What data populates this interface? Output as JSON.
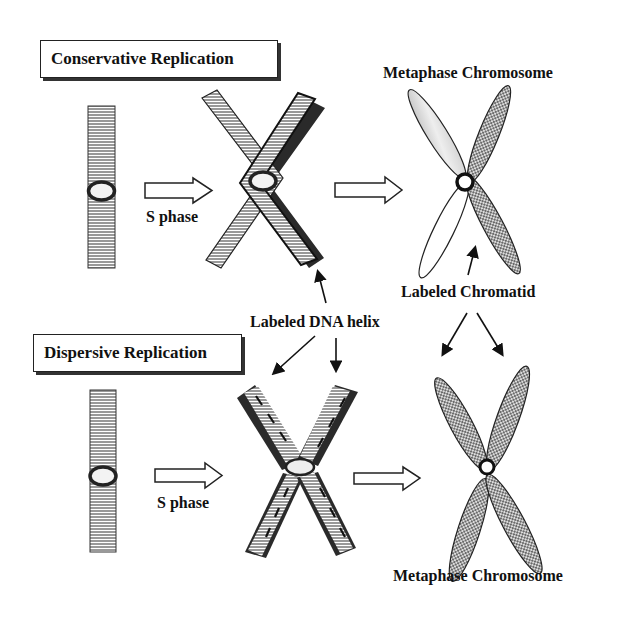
{
  "diagram": {
    "conservative": {
      "title": "Conservative Replication",
      "step_label": "S phase",
      "result_label": "Metaphase Chromosome"
    },
    "dispersive": {
      "title": "Dispersive Replication",
      "step_label": "S phase",
      "result_label": "Metaphase Chromosome"
    },
    "annotations": {
      "labeled_dna_helix": "Labeled DNA helix",
      "labeled_chromatid": "Labeled Chromatid"
    },
    "colors": {
      "ink": "#1a1a1a",
      "dark_strand": "#2a2a2a",
      "stipple": "#555555",
      "background": "#ffffff"
    }
  }
}
